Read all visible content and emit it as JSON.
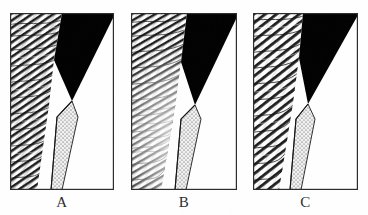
{
  "figure": {
    "kind": "scanned-line-figure",
    "background_color": "#ffffff",
    "ink_color": "#1a1a1a",
    "panel_border_color": "#2b2b2b",
    "panel_count": 3,
    "caption_font_style": "serif"
  },
  "panels": [
    {
      "id": "panel-a",
      "label": "A",
      "frame": {
        "x": 10,
        "y": 13,
        "width": 104,
        "height": 177
      },
      "regions": [
        {
          "name": "hatched-footwall",
          "fill_style": "diagonal-line-hatch",
          "tone": "dark",
          "hatch_angle_deg": 34,
          "hatch_spacing_px": 2.4,
          "description": "dense curving parallel line hatch occupying the left portion of the panel"
        },
        {
          "name": "black-wedge",
          "fill_style": "solid",
          "color": "#000000",
          "description": "solid black tapering wedge descending from the top edge to the triple junction"
        },
        {
          "name": "stippled-band",
          "fill_style": "stipple-dots",
          "tone": "light",
          "description": "thin outlined band with dot stipple along the steep contact"
        },
        {
          "name": "white-hangingwall",
          "fill_style": "blank",
          "color": "#ffffff",
          "description": "unornamented white region filling the lower right"
        }
      ],
      "triple_junction": {
        "x": 62,
        "y": 88
      }
    },
    {
      "id": "panel-b",
      "label": "B",
      "frame": {
        "x": 131,
        "y": 13,
        "width": 106,
        "height": 177
      },
      "regions": [
        {
          "name": "hatched-footwall",
          "fill_style": "diagonal-line-hatch",
          "tone": "mottled",
          "hatch_angle_deg": 30,
          "hatch_spacing_px": 2.6,
          "description": "curving line hatch that fades to a pale washed-out mottle in the lower middle"
        },
        {
          "name": "black-wedge",
          "fill_style": "solid",
          "color": "#000000",
          "description": "solid black tapering wedge descending from the top edge to the triple junction"
        },
        {
          "name": "stippled-band",
          "fill_style": "stipple-dots",
          "tone": "light",
          "description": "thin outlined band with dot stipple along the steep contact"
        },
        {
          "name": "white-hangingwall",
          "fill_style": "blank",
          "color": "#ffffff",
          "description": "unornamented white region filling the lower right"
        }
      ],
      "triple_junction": {
        "x": 193,
        "y": 92
      }
    },
    {
      "id": "panel-c",
      "label": "C",
      "frame": {
        "x": 253,
        "y": 13,
        "width": 105,
        "height": 177
      },
      "regions": [
        {
          "name": "hatched-footwall",
          "fill_style": "diagonal-line-hatch",
          "tone": "coarse",
          "hatch_angle_deg": 38,
          "hatch_spacing_px": 3.2,
          "description": "coarser, more widely spaced curving line hatch"
        },
        {
          "name": "black-wedge",
          "fill_style": "solid",
          "color": "#000000",
          "description": "solid black tapering wedge descending from the top edge to the triple junction"
        },
        {
          "name": "stippled-band",
          "fill_style": "stipple-dots",
          "tone": "light",
          "description": "thin outlined band with dot stipple along the steep contact"
        },
        {
          "name": "white-hangingwall",
          "fill_style": "blank",
          "color": "#ffffff",
          "description": "unornamented white region filling the lower right"
        }
      ],
      "triple_junction": {
        "x": 307,
        "y": 91
      }
    }
  ],
  "labels": {
    "a": "A",
    "b": "B",
    "c": "C"
  }
}
